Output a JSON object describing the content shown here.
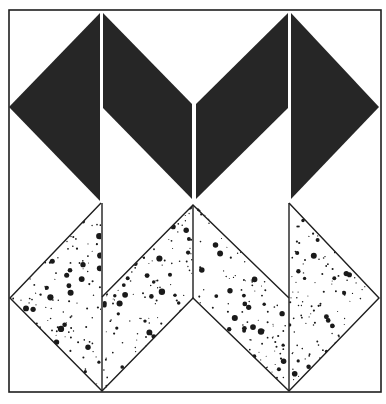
{
  "figure": {
    "kind": "quilt-block-illustration",
    "canvas": {
      "width": 386,
      "height": 404,
      "background": "#ffffff"
    },
    "colors": {
      "ink": "#1e1e1e",
      "solid_fill": "#262626",
      "speckle_bg": "#ffffff",
      "speckle_dot": "#1a1a1a",
      "seam_gap": "#ffffff"
    },
    "frame": {
      "x1": 9,
      "y1": 10,
      "x2": 381,
      "y2": 392,
      "stroke_width": 1.6
    },
    "solid_top_zigzag": {
      "description": "Black M-shaped chevron band, two diamonds split by vertical seams",
      "polygons": [
        [
          [
            9,
            107
          ],
          [
            100,
            13
          ],
          [
            100,
            201
          ]
        ],
        [
          [
            103,
            13
          ],
          [
            192,
            104
          ],
          [
            192,
            199
          ],
          [
            103,
            108
          ]
        ],
        [
          [
            196,
            104
          ],
          [
            288,
            13
          ],
          [
            288,
            108
          ],
          [
            196,
            199
          ]
        ],
        [
          [
            291,
            13
          ],
          [
            379,
            107
          ],
          [
            291,
            199
          ]
        ]
      ],
      "seam_lines": [
        {
          "x": 101.5,
          "y1": 12,
          "y2": 201
        },
        {
          "x": 194,
          "y1": 103,
          "y2": 201
        },
        {
          "x": 289.5,
          "y1": 12,
          "y2": 201
        }
      ]
    },
    "speckled_bottom_zigzag": {
      "description": "Speckled W-shaped chevron band beneath the solid band",
      "polygons": [
        [
          [
            101,
            203
          ],
          [
            10,
            298
          ],
          [
            101,
            391
          ]
        ],
        [
          [
            103,
            297
          ],
          [
            193,
            205
          ],
          [
            193,
            298
          ],
          [
            103,
            391
          ]
        ],
        [
          [
            195,
            205
          ],
          [
            287,
            298
          ],
          [
            287,
            391
          ],
          [
            195,
            298
          ]
        ],
        [
          [
            289,
            203
          ],
          [
            379,
            298
          ],
          [
            289,
            391
          ]
        ]
      ],
      "outline_lines": [
        [
          [
            101,
            203
          ],
          [
            10,
            298
          ],
          [
            102,
            391
          ],
          [
            193,
            298
          ],
          [
            289,
            391
          ],
          [
            379,
            298
          ],
          [
            289,
            203
          ]
        ],
        [
          [
            102,
            297
          ],
          [
            193,
            205
          ],
          [
            289,
            298
          ]
        ],
        [
          [
            102,
            203
          ],
          [
            102,
            391
          ]
        ],
        [
          [
            193,
            205
          ],
          [
            193,
            298
          ]
        ],
        [
          [
            289,
            203
          ],
          [
            289,
            391
          ]
        ]
      ],
      "speckle": {
        "seed": 7321,
        "large_dots_per_region": 48,
        "small_dots_per_region": 160,
        "large_r": [
          1.6,
          3.2
        ],
        "small_r": [
          0.5,
          1.1
        ]
      }
    }
  }
}
